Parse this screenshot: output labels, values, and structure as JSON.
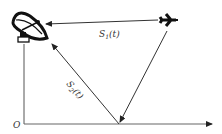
{
  "diagram": {
    "labels": {
      "direct_path": "S",
      "direct_path_sub": "1",
      "direct_path_arg": "(t)",
      "reflected_path": "S",
      "reflected_path_sub": "2",
      "reflected_path_arg": "(t)",
      "origin": "O"
    },
    "nodes": [
      {
        "id": "antenna",
        "type": "radar-dish",
        "x": 30,
        "y": 27
      },
      {
        "id": "aircraft",
        "type": "airplane",
        "x": 168,
        "y": 20
      },
      {
        "id": "reflection_point",
        "type": "ground-point",
        "x": 119,
        "y": 124
      },
      {
        "id": "origin",
        "type": "axis-origin",
        "x": 24,
        "y": 124
      }
    ],
    "edges": [
      {
        "from": "aircraft",
        "to": "antenna",
        "label": "S1(t)",
        "arrow": "end"
      },
      {
        "from": "aircraft",
        "to": "reflection_point",
        "arrow": "end"
      },
      {
        "from": "reflection_point",
        "to": "antenna",
        "label": "S2(t)",
        "arrow": "end"
      }
    ],
    "colors": {
      "line": "#333333",
      "axis": "#555555",
      "icon": "#111111",
      "background": "#ffffff"
    }
  }
}
